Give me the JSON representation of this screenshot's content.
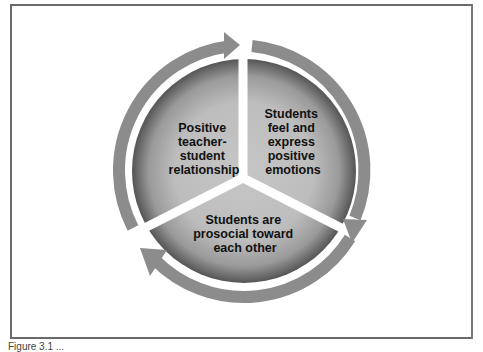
{
  "diagram": {
    "type": "cycle",
    "segments": [
      {
        "id": "left",
        "lines": [
          "Positive",
          "teacher-",
          "student",
          "relationship"
        ]
      },
      {
        "id": "right",
        "lines": [
          "Students",
          "feel and",
          "express",
          "positive",
          "emotions"
        ]
      },
      {
        "id": "bottom",
        "lines": [
          "Students are",
          "prosocial toward",
          "each other"
        ]
      }
    ],
    "arrows": [
      {
        "from": "left",
        "to": "right",
        "direction": "clockwise"
      },
      {
        "from": "right",
        "to": "bottom",
        "direction": "clockwise"
      },
      {
        "from": "bottom",
        "to": "left",
        "direction": "clockwise"
      }
    ],
    "colors": {
      "segment_center": "#c4c4c4",
      "segment_edge": "#5a5a5a",
      "arrow": "#8c8c8c",
      "frame": "#6a6a6a",
      "text": "#111111"
    }
  },
  "caption": {
    "text": "Figure 3.1 ..."
  }
}
